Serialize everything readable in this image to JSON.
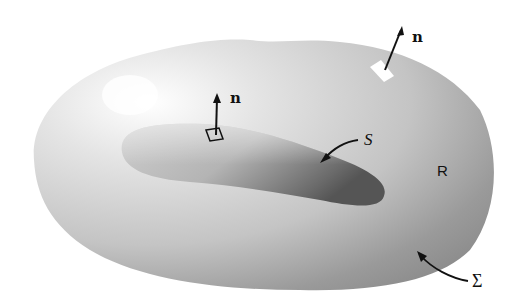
{
  "figure": {
    "labels": {
      "normal_top": "n",
      "normal_inner": "n",
      "inner_surface": "S",
      "region": "R",
      "outer_surface": "Σ"
    },
    "colors": {
      "background": "#ffffff",
      "outer_body_light": "#f4f4f4",
      "outer_body_dark": "#8c8c8c",
      "inner_body_dark": "#5a5a5a",
      "ink": "#111111"
    }
  }
}
